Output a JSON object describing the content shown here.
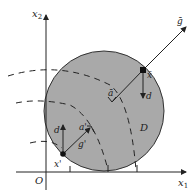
{
  "diagram": {
    "axes": {
      "x_label": "x",
      "x_sub": "1",
      "y_label": "x",
      "y_sub": "2",
      "origin_label": "O"
    },
    "region_label": "D",
    "points": {
      "x_bar": "x̄",
      "a_bar": "ā",
      "x_prime": "x'",
      "a_prime": "a'"
    },
    "vectors": {
      "g_bar": "ḡ",
      "g_prime": "g'",
      "d_top": "d",
      "d_bottom": "d"
    },
    "colors": {
      "disk_fill": "#a9a9a9",
      "stroke": "#222222",
      "background": "#ffffff"
    }
  }
}
